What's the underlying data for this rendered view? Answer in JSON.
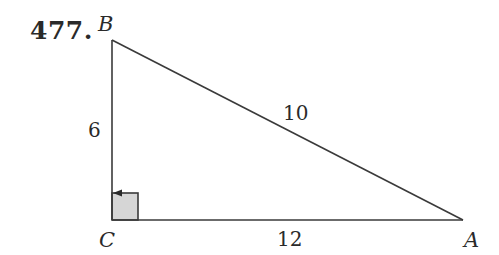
{
  "problem_number": "477.",
  "figure": {
    "type": "right-triangle",
    "vertices": {
      "B": {
        "label": "B"
      },
      "C": {
        "label": "C"
      },
      "A": {
        "label": "A"
      }
    },
    "sides": {
      "BC": {
        "label": "6"
      },
      "BA": {
        "label": "10"
      },
      "CA": {
        "label": "12"
      }
    },
    "right_angle_at": "C",
    "colors": {
      "line": "#3a3a3a",
      "right_angle_fill": "#d4d4d4"
    }
  }
}
